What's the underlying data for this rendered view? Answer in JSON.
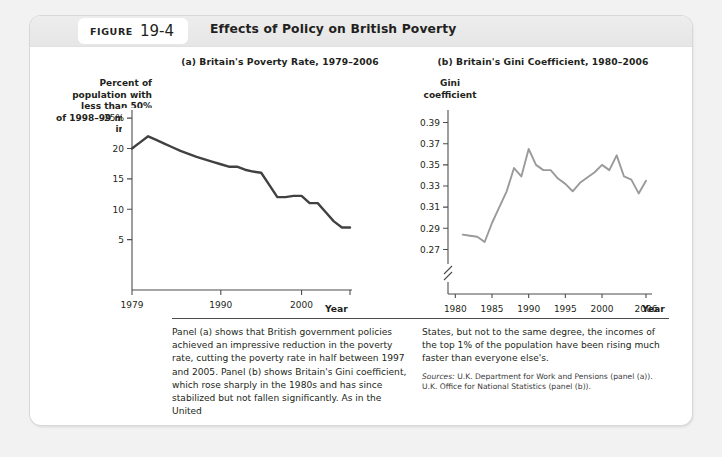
{
  "figure": {
    "badge_word": "Figure",
    "badge_number": "19-4",
    "title": "Effects of Policy on British Poverty"
  },
  "panel_a": {
    "title": "(a) Britain's Poverty Rate, 1979–2006",
    "ylabel_lines": [
      "Percent of",
      "population with",
      "less than 50%",
      "of 1998–99 median",
      "income"
    ],
    "xlabel": "Year"
  },
  "panel_b": {
    "title": "(b) Britain's Gini Coefficient, 1980–2006",
    "ylabel_lines": [
      "Gini",
      "coefficient"
    ],
    "xlabel": "Year"
  },
  "caption": {
    "left": "Panel (a) shows that British government policies achieved an impressive reduction in the poverty rate, cutting the poverty rate in half between 1997 and 2005. Panel (b) shows Britain's Gini coefficient, which rose sharply in the 1980s and has since stabilized but not fallen significantly. As in the United",
    "right": "States, but not to the same degree, the incomes of the top 1% of the population have been rising much faster than everyone else's.",
    "sources_label": "Sources:",
    "sources_line1": "U.K. Department for Work and Pensions (panel (a)).",
    "sources_line2": "U.K. Office for National Statistics (panel (b))."
  },
  "colors": {
    "page_background": "#f2f2f2",
    "card_background": "#ffffff",
    "header_band": "#ececec",
    "text": "#231f20",
    "axis": "#4d4d4d",
    "series_a": "#414141",
    "series_b": "#9a9a9a"
  },
  "chart_data": [
    {
      "type": "line",
      "id": "panel-a",
      "title": "(a) Britain's Poverty Rate, 1979–2006",
      "xlabel": "Year",
      "ylabel": "Percent of population with less than 50% of 1998–99 median income",
      "xlim": [
        1979,
        2006
      ],
      "ylim": [
        0,
        26
      ],
      "xticks": [
        1979,
        1990,
        2000,
        2006
      ],
      "yticks": [
        5,
        10,
        15,
        20,
        25
      ],
      "ytick_labels": [
        "5",
        "10",
        "15",
        "20",
        "25%"
      ],
      "grid": false,
      "legend": "none",
      "x": [
        1979,
        1980,
        1981,
        1982,
        1983,
        1984,
        1985,
        1986,
        1987,
        1988,
        1989,
        1990,
        1991,
        1992,
        1993,
        1994,
        1995,
        1996,
        1997,
        1998,
        1999,
        2000,
        2001,
        2002,
        2003,
        2004,
        2005,
        2006
      ],
      "values": [
        20.0,
        21.0,
        22.0,
        21.4,
        20.8,
        20.2,
        19.6,
        19.1,
        18.6,
        18.2,
        17.8,
        17.4,
        17.0,
        17.0,
        16.5,
        16.2,
        16.0,
        14.0,
        12.0,
        12.0,
        12.2,
        12.2,
        11.0,
        11.0,
        9.5,
        8.0,
        7.0,
        7.0
      ]
    },
    {
      "type": "line",
      "id": "panel-b",
      "title": "(b) Britain's Gini Coefficient, 1980–2006",
      "xlabel": "Year",
      "ylabel": "Gini coefficient",
      "xlim": [
        1979,
        2006
      ],
      "ylim": [
        0.26,
        0.4
      ],
      "axis_break": true,
      "xticks": [
        1980,
        1985,
        1990,
        1995,
        2000,
        2006
      ],
      "yticks": [
        0.27,
        0.29,
        0.31,
        0.33,
        0.35,
        0.37,
        0.39
      ],
      "ytick_labels": [
        "0.27",
        "0.29",
        "0.31",
        "0.33",
        "0.35",
        "0.37",
        "0.39"
      ],
      "grid": false,
      "legend": "none",
      "x": [
        1981,
        1982,
        1983,
        1984,
        1985,
        1986,
        1987,
        1988,
        1989,
        1990,
        1991,
        1992,
        1993,
        1994,
        1995,
        1996,
        1997,
        1998,
        1999,
        2000,
        2001,
        2002,
        2003,
        2004,
        2005,
        2006
      ],
      "values": [
        0.284,
        0.283,
        0.282,
        0.277,
        0.295,
        0.31,
        0.325,
        0.347,
        0.339,
        0.365,
        0.35,
        0.345,
        0.345,
        0.337,
        0.332,
        0.325,
        0.333,
        0.338,
        0.343,
        0.35,
        0.345,
        0.359,
        0.339,
        0.336,
        0.323,
        0.335
      ]
    }
  ]
}
